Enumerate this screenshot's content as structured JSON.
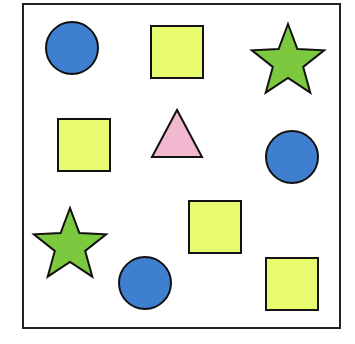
{
  "diagram": {
    "type": "shape-grid",
    "frame": {
      "x": 23,
      "y": 4,
      "width": 317,
      "height": 324,
      "stroke": "#222222"
    },
    "colors": {
      "circle": "#3f7fcf",
      "square": "#e8fa6e",
      "star": "#7cc83f",
      "triangle": "#f2b8cf",
      "outline": "#111111"
    },
    "shapes": [
      {
        "kind": "circle",
        "name": "circle-top-left",
        "cx": 72,
        "cy": 48,
        "r": 26
      },
      {
        "kind": "square",
        "name": "square-top-center",
        "x": 151,
        "y": 26,
        "size": 52
      },
      {
        "kind": "star",
        "name": "star-top-right",
        "cx": 288,
        "cy": 62,
        "r": 38
      },
      {
        "kind": "square",
        "name": "square-middle-left",
        "x": 58,
        "y": 119,
        "size": 52
      },
      {
        "kind": "triangle",
        "name": "triangle-middle-center",
        "x1": 177,
        "y1": 110,
        "x2": 152,
        "y2": 157,
        "x3": 202,
        "y3": 157
      },
      {
        "kind": "circle",
        "name": "circle-middle-right",
        "cx": 292,
        "cy": 157,
        "r": 26
      },
      {
        "kind": "star",
        "name": "star-bottom-left",
        "cx": 70,
        "cy": 246,
        "r": 38
      },
      {
        "kind": "circle",
        "name": "circle-bottom-center",
        "cx": 145,
        "cy": 283,
        "r": 26
      },
      {
        "kind": "square",
        "name": "square-bottom-center",
        "x": 189,
        "y": 201,
        "size": 52
      },
      {
        "kind": "square",
        "name": "square-bottom-right",
        "x": 266,
        "y": 258,
        "size": 52
      }
    ],
    "counts": {
      "circle": 3,
      "square": 4,
      "star": 2,
      "triangle": 1
    }
  }
}
